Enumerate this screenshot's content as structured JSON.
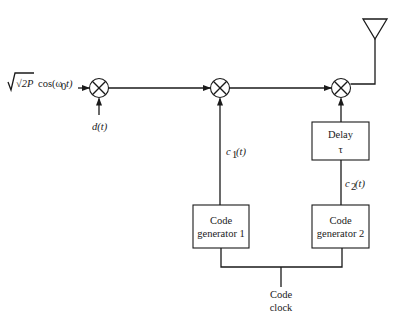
{
  "diagram": {
    "type": "block-diagram",
    "input_signal": {
      "label_sqrt": "√2P",
      "label_cos": "cos(ω",
      "label_sub": "0",
      "label_tail": "t)"
    },
    "data_signal": {
      "label": "d(t)"
    },
    "blocks": {
      "delay": {
        "line1": "Delay",
        "line2": "τ"
      },
      "code_gen_1": {
        "line1": "Code",
        "line2": "generator 1"
      },
      "code_gen_2": {
        "line1": "Code",
        "line2": "generator 2"
      }
    },
    "signals": {
      "c1": {
        "main": "c",
        "sub": "1",
        "tail": "(t)"
      },
      "c2": {
        "main": "c",
        "sub": "2",
        "tail": "(t)"
      }
    },
    "clock": {
      "line1": "Code",
      "line2": "clock"
    },
    "nodes": [
      {
        "id": "mixer-1",
        "type": "multiplier"
      },
      {
        "id": "mixer-2",
        "type": "multiplier"
      },
      {
        "id": "mixer-3",
        "type": "multiplier"
      },
      {
        "id": "antenna",
        "type": "antenna"
      }
    ],
    "edges": [
      [
        "input",
        "mixer-1"
      ],
      [
        "d(t)",
        "mixer-1"
      ],
      [
        "mixer-1",
        "mixer-2"
      ],
      [
        "code_gen_1",
        "mixer-2"
      ],
      [
        "mixer-2",
        "mixer-3"
      ],
      [
        "code_gen_2",
        "delay"
      ],
      [
        "delay",
        "mixer-3"
      ],
      [
        "mixer-3",
        "antenna"
      ],
      [
        "clock",
        "code_gen_1"
      ],
      [
        "clock",
        "code_gen_2"
      ]
    ]
  }
}
